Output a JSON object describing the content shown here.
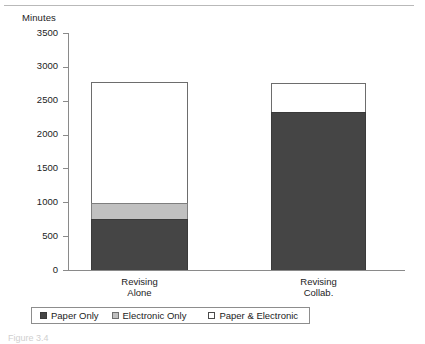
{
  "figure": {
    "caption": "Figure 3.4"
  },
  "chart_data": {
    "type": "bar",
    "stacked": true,
    "title": "",
    "xlabel": "",
    "ylabel": "Minutes",
    "ylim": [
      0,
      3500
    ],
    "ytick_step": 500,
    "yticks": [
      3500,
      3000,
      2500,
      2000,
      1500,
      1000,
      500,
      0
    ],
    "ytick_labels": [
      "3500",
      "3000",
      "2500",
      "2000",
      "1500",
      "1000",
      "500",
      "0"
    ],
    "grid": false,
    "legend_position": "bottom",
    "categories": [
      "Revising Alone",
      "Revising Collab."
    ],
    "category_lines": [
      [
        "Revising",
        "Alone"
      ],
      [
        "Revising",
        "Collab."
      ]
    ],
    "series": [
      {
        "name": "Paper  Only",
        "color": "#454545",
        "values": [
          750,
          2330
        ]
      },
      {
        "name": "Electronic Only",
        "color": "#c0c0c0",
        "values": [
          240,
          0
        ]
      },
      {
        "name": "Paper  & Electronic",
        "color": "#ffffff",
        "values": [
          1790,
          430
        ]
      }
    ],
    "totals": [
      2780,
      2760
    ]
  }
}
